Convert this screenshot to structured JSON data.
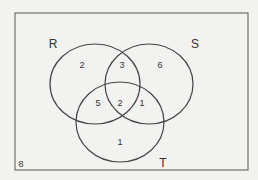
{
  "diagram": {
    "type": "venn",
    "sets": [
      {
        "name": "R",
        "label": "R"
      },
      {
        "name": "S",
        "label": "S"
      },
      {
        "name": "T",
        "label": "T"
      }
    ],
    "regions": {
      "R_only": "2",
      "R_and_S_only": "3",
      "S_only": "6",
      "R_and_T_only": "5",
      "R_S_T": "2",
      "S_and_T_only": "1",
      "T_only": "1",
      "outside": "8"
    },
    "colors": {
      "stroke": "#444444",
      "background": "#f2f2f0"
    }
  }
}
